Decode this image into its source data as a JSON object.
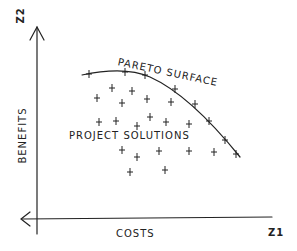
{
  "diagram": {
    "axes": {
      "y_name": "Z2",
      "y_label": "BENEFITS",
      "x_name": "Z1",
      "x_label": "COSTS"
    },
    "labels": {
      "curve": "PARETO SURFACE",
      "cloud": "PROJECT SOLUTIONS"
    },
    "pareto_points": [
      [
        89,
        74
      ],
      [
        125,
        72
      ],
      [
        145,
        75
      ],
      [
        175,
        89
      ],
      [
        195,
        104
      ],
      [
        209,
        121
      ],
      [
        225,
        140
      ],
      [
        236,
        154
      ]
    ],
    "solution_points": [
      [
        112,
        88
      ],
      [
        132,
        91
      ],
      [
        97,
        98
      ],
      [
        122,
        103
      ],
      [
        147,
        99
      ],
      [
        171,
        102
      ],
      [
        99,
        122
      ],
      [
        116,
        121
      ],
      [
        137,
        126
      ],
      [
        150,
        117
      ],
      [
        166,
        122
      ],
      [
        189,
        124
      ],
      [
        122,
        150
      ],
      [
        137,
        157
      ],
      [
        159,
        151
      ],
      [
        189,
        151
      ],
      [
        214,
        152
      ],
      [
        130,
        172
      ],
      [
        165,
        170
      ]
    ],
    "colors": {
      "ink": "#222222",
      "background": "#ffffff"
    }
  }
}
